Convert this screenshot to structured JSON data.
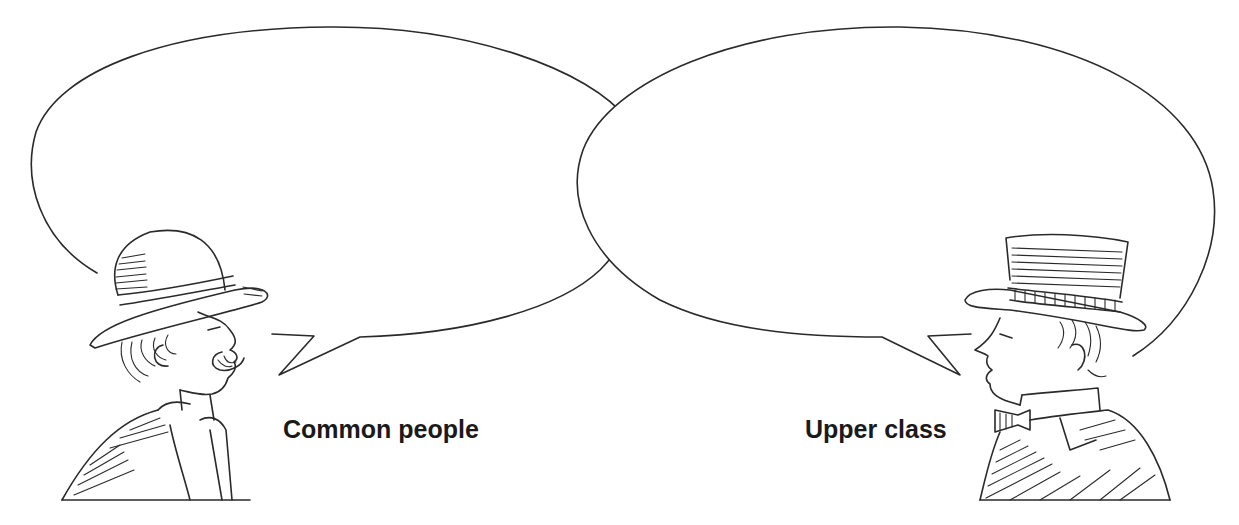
{
  "illustration": {
    "type": "two speech bubbles with figures",
    "left_figure": {
      "label": "Common people",
      "description": "man in bowler hat with moustache, facing right",
      "hat": "bowler-hat"
    },
    "right_figure": {
      "label": "Upper class",
      "description": "man in top hat with bow tie and high collar, facing left",
      "hat": "top-hat"
    },
    "bubbles": [
      {
        "id": "left-bubble",
        "text": ""
      },
      {
        "id": "right-bubble",
        "text": ""
      }
    ],
    "colors": {
      "stroke": "#2a2a2a",
      "background": "#ffffff",
      "label": "#1a1a1a"
    }
  }
}
